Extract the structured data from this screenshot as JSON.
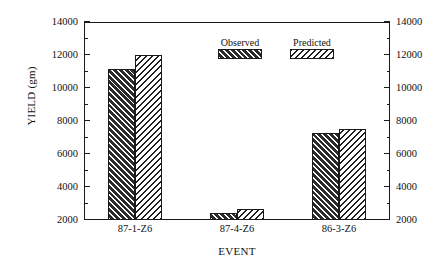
{
  "chart_data": {
    "type": "bar",
    "title": "",
    "subtitle": "",
    "xlabel": "EVENT",
    "ylabel": "YIELD (gm)",
    "categories": [
      "87-1-Z6",
      "87-4-Z6",
      "86-3-Z6"
    ],
    "series": [
      {
        "name": "Observed",
        "values": [
          11150,
          2450,
          7250
        ]
      },
      {
        "name": "Predicted",
        "values": [
          12000,
          2650,
          7500
        ]
      }
    ],
    "ylim": [
      2000,
      14000
    ],
    "ytick_major": [
      2000,
      4000,
      6000,
      8000,
      10000,
      12000,
      14000
    ],
    "ytick_minor": [
      3000,
      5000,
      7000,
      9000,
      11000,
      13000
    ],
    "ytick_labels_left": [
      "2000",
      "4000",
      "6000",
      "8000",
      "10000",
      "12000",
      "14000"
    ],
    "ytick_labels_right": [
      "2000",
      "4000",
      "6000",
      "8000",
      "10000",
      "12000",
      "14000"
    ],
    "grid": false,
    "legend_position": "upper-center-right",
    "legend": [
      {
        "label": "Observed",
        "pattern": "dark-fill-light-forward-diagonal"
      },
      {
        "label": "Predicted",
        "pattern": "light-fill-dark-back-diagonal"
      }
    ],
    "colors": {
      "observed_fill": "#2b2b2b",
      "observed_stripe": "#ffffff",
      "predicted_fill": "#ffffff",
      "predicted_stripe": "#1f1f1f",
      "axis": "#1a1a1a",
      "background": "#ffffff"
    },
    "axes_both_sides": true
  }
}
